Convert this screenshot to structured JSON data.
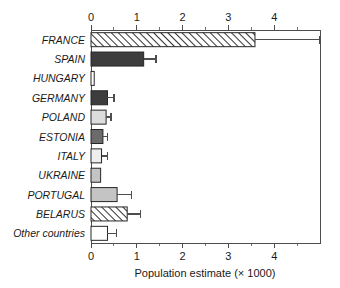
{
  "chart_data": {
    "type": "bar",
    "orientation": "horizontal",
    "title": "",
    "subtitle": "",
    "xlabel": "Population estimate (× 1000)",
    "ylabel": "",
    "xlim": [
      0,
      5
    ],
    "ylim": null,
    "grid": false,
    "legend": null,
    "legend_position": "none",
    "x_ticks_top": [
      "0",
      "1",
      "2",
      "3",
      "4"
    ],
    "x_tick_values_top": [
      0,
      1,
      2,
      3,
      4
    ],
    "x_ticks_bottom": [
      "0",
      "1",
      "2",
      "3",
      "4"
    ],
    "x_tick_values_bottom": [
      0,
      1,
      2,
      3,
      4
    ],
    "minor_ticks": true,
    "minor_tick_step": 0.5,
    "categories": [
      "FRANCE",
      "SPAIN",
      "HUNGARY",
      "GERMANY",
      "POLAND",
      "ESTONIA",
      "ITALY",
      "UKRAINE",
      "PORTUGAL",
      "BELARUS",
      "Other countries"
    ],
    "values": [
      3.58,
      1.15,
      0.07,
      0.36,
      0.33,
      0.26,
      0.23,
      0.21,
      0.57,
      0.79,
      0.36
    ],
    "error_high": [
      5.0,
      1.42,
      0.07,
      0.5,
      0.44,
      0.36,
      0.36,
      0.21,
      0.88,
      1.08,
      0.56
    ],
    "fills": [
      "hatch",
      "dark",
      "white",
      "dark",
      "light",
      "mediumdark",
      "verylight",
      "medium",
      "medium",
      "hatch",
      "white"
    ],
    "fill_colors": {
      "white": "#ffffff",
      "verylight": "#eeeeee",
      "light": "#dcdcdc",
      "medium": "#c4c4c4",
      "mediumdark": "#6b6b6b",
      "dark": "#3d3d3d",
      "hatch": "#ffffff"
    },
    "bar_edge_color": "#262626",
    "hatch_line_color": "#333333",
    "error_bar_color": "#4d4d4d",
    "axis_color": "#4d4d4d",
    "background_color": "#ffffff"
  }
}
